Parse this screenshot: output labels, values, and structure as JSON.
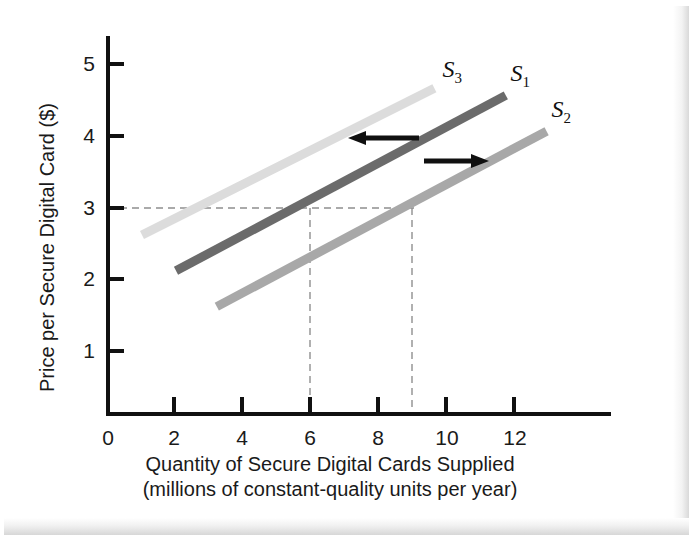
{
  "figure": {
    "background_color": "#ffffff",
    "frame_color": "#e2e2e2"
  },
  "axes": {
    "y_title": "Price per Secure Digital Card ($)",
    "x_title_line1": "Quantity of Secure Digital Cards Supplied",
    "x_title_line2": "(millions of constant-quality units per year)",
    "y_ticks": [
      "1",
      "2",
      "3",
      "4",
      "5"
    ],
    "x_ticks": [
      "0",
      "2",
      "4",
      "6",
      "8",
      "10",
      "12"
    ],
    "axis_color": "#111111"
  },
  "annotations": {
    "arrow_left_name": "leftward-shift-arrow",
    "arrow_right_name": "rightward-shift-arrow",
    "guide_price": "3",
    "guide_quantity_1": "6",
    "guide_quantity_2": "9",
    "guide_color": "#8f8f8f"
  },
  "chart_data": {
    "type": "line",
    "title": "",
    "xlabel": "Quantity of Secure Digital Cards Supplied (millions of constant-quality units per year)",
    "ylabel": "Price per Secure Digital Card ($)",
    "xlim": [
      0,
      13.6
    ],
    "ylim": [
      0,
      5.6
    ],
    "x_ticks": [
      0,
      2,
      4,
      6,
      8,
      10,
      12
    ],
    "y_ticks": [
      1,
      2,
      3,
      4,
      5
    ],
    "grid": false,
    "legend": "inline-curve-labels",
    "series": [
      {
        "name": "S1",
        "label": "S",
        "subscript": "1",
        "color": "#6b6b6b",
        "role": "original-supply-curve",
        "points": [
          {
            "x": 2.0,
            "y": 2.0
          },
          {
            "x": 11.7,
            "y": 4.45
          }
        ],
        "label_position": {
          "x": 11.9,
          "y": 4.72
        }
      },
      {
        "name": "S2",
        "label": "S",
        "subscript": "2",
        "color": "#a8a8a8",
        "role": "increase-in-supply-shift-right",
        "points": [
          {
            "x": 3.2,
            "y": 1.5
          },
          {
            "x": 12.9,
            "y": 3.95
          }
        ],
        "label_position": {
          "x": 13.1,
          "y": 4.22
        }
      },
      {
        "name": "S3",
        "label": "S",
        "subscript": "3",
        "color": "#dcdcdc",
        "role": "decrease-in-supply-shift-left",
        "points": [
          {
            "x": 1.0,
            "y": 2.5
          },
          {
            "x": 9.6,
            "y": 4.55
          }
        ],
        "label_position": {
          "x": 9.9,
          "y": 4.78
        }
      }
    ],
    "annotations": [
      {
        "type": "arrow",
        "direction": "left",
        "name": "leftward-shift-arrow",
        "from": {
          "x": 8.8,
          "y": 4.0
        },
        "to": {
          "x": 7.2,
          "y": 4.0
        },
        "color": "#101010"
      },
      {
        "type": "arrow",
        "direction": "right",
        "name": "rightward-shift-arrow",
        "from": {
          "x": 8.6,
          "y": 3.62
        },
        "to": {
          "x": 10.1,
          "y": 3.62
        },
        "color": "#101010"
      },
      {
        "type": "dashed-guide-horizontal",
        "name": "price-3-guide",
        "y": 3,
        "x_from": 0,
        "x_to": 9.0,
        "color": "#8f8f8f"
      },
      {
        "type": "dashed-guide-vertical",
        "name": "quantity-6-guide",
        "x": 6,
        "y_from": 0,
        "y_to": 3,
        "color": "#8f8f8f"
      },
      {
        "type": "dashed-guide-vertical",
        "name": "quantity-9-guide",
        "x": 9,
        "y_from": 0,
        "y_to": 3,
        "color": "#8f8f8f"
      }
    ]
  }
}
